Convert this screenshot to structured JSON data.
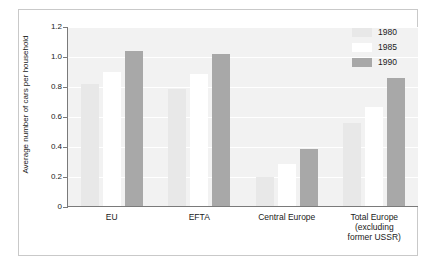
{
  "chart_data": {
    "type": "bar",
    "title": "",
    "subtitle": "",
    "xlabel": "",
    "ylabel": "Average number of cars per household",
    "ylim": [
      0,
      1.2
    ],
    "yticks": [
      0,
      0.2,
      0.4,
      0.6,
      0.8,
      1.0,
      1.2
    ],
    "ytick_labels": [
      "0",
      "0.2",
      "0.4",
      "0.6",
      "0.8",
      "1.0",
      "1.2"
    ],
    "grid": true,
    "grid_axis": "y",
    "legend_position": "top-right",
    "categories": [
      "EU",
      "EFTA",
      "Central Europe",
      "Total Europe (excluding former USSR)"
    ],
    "category_lines": [
      [
        "EU"
      ],
      [
        "EFTA"
      ],
      [
        "Central Europe"
      ],
      [
        "Total Europe",
        "(excluding",
        "former USSR)"
      ]
    ],
    "series": [
      {
        "name": "1980",
        "color": "#e8e8e8",
        "values": [
          0.82,
          0.79,
          0.2,
          0.56
        ]
      },
      {
        "name": "1985",
        "color": "#ffffff",
        "values": [
          0.9,
          0.89,
          0.29,
          0.67
        ]
      },
      {
        "name": "1990",
        "color": "#a8a8a8",
        "values": [
          1.04,
          1.02,
          0.39,
          0.86
        ]
      }
    ],
    "plot_background": "#f2f2f2",
    "gridline_color": "#ffffff",
    "axis_color": "#7a7a7a"
  },
  "legend": {
    "entries": [
      {
        "label": "1980"
      },
      {
        "label": "1985"
      },
      {
        "label": "1990"
      }
    ]
  }
}
